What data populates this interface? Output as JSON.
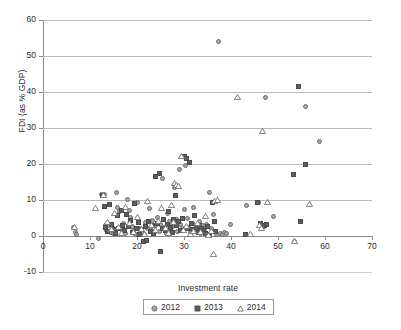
{
  "chart_data": {
    "type": "scatter",
    "title": "",
    "xlabel": "Investment rate",
    "ylabel": "FDI (as % GDP)",
    "xlim": [
      0,
      70
    ],
    "ylim": [
      -10,
      60
    ],
    "xticks": [
      0,
      10,
      20,
      30,
      40,
      50,
      60,
      70
    ],
    "yticks": [
      -10,
      0,
      10,
      20,
      30,
      40,
      50,
      60
    ],
    "grid": "horizontal",
    "legend_position": "bottom",
    "series": [
      {
        "name": "2012",
        "marker": "circle",
        "color": "#a8a8a8",
        "points": [
          [
            6.4,
            2.3
          ],
          [
            6.9,
            1.1
          ],
          [
            7.1,
            0.4
          ],
          [
            11.8,
            -0.8
          ],
          [
            12.4,
            11.4
          ],
          [
            13.0,
            11.6
          ],
          [
            13.2,
            2.8
          ],
          [
            13.6,
            1.5
          ],
          [
            14.0,
            3.0
          ],
          [
            14.3,
            1.0
          ],
          [
            14.8,
            2.4
          ],
          [
            15.1,
            0.6
          ],
          [
            15.6,
            12.2
          ],
          [
            15.9,
            7.8
          ],
          [
            16.2,
            6.9
          ],
          [
            16.5,
            2.1
          ],
          [
            16.9,
            1.2
          ],
          [
            17.2,
            3.4
          ],
          [
            17.6,
            0.8
          ],
          [
            18.0,
            10.1
          ],
          [
            18.3,
            7.1
          ],
          [
            18.6,
            5.2
          ],
          [
            19.0,
            2.6
          ],
          [
            19.3,
            1.4
          ],
          [
            19.7,
            0.5
          ],
          [
            20.1,
            9.3
          ],
          [
            20.4,
            4.2
          ],
          [
            20.8,
            2.0
          ],
          [
            21.1,
            1.1
          ],
          [
            21.5,
            0.3
          ],
          [
            21.9,
            3.8
          ],
          [
            22.2,
            2.2
          ],
          [
            22.6,
            7.6
          ],
          [
            23.0,
            1.6
          ],
          [
            23.3,
            4.4
          ],
          [
            23.7,
            0.9
          ],
          [
            24.0,
            2.9
          ],
          [
            24.4,
            5.1
          ],
          [
            24.8,
            1.3
          ],
          [
            25.1,
            3.1
          ],
          [
            25.5,
            15.9
          ],
          [
            25.8,
            2.4
          ],
          [
            26.2,
            0.7
          ],
          [
            26.5,
            6.2
          ],
          [
            26.9,
            4.0
          ],
          [
            27.2,
            1.9
          ],
          [
            27.6,
            2.7
          ],
          [
            27.9,
            13.4
          ],
          [
            28.3,
            4.6
          ],
          [
            28.6,
            1.2
          ],
          [
            29.0,
            18.6
          ],
          [
            29.3,
            3.2
          ],
          [
            29.7,
            2.1
          ],
          [
            30.0,
            7.4
          ],
          [
            30.3,
            19.6
          ],
          [
            30.7,
            4.8
          ],
          [
            31.0,
            2.5
          ],
          [
            31.4,
            1.0
          ],
          [
            31.8,
            3.6
          ],
          [
            32.1,
            7.8
          ],
          [
            32.5,
            2.2
          ],
          [
            32.9,
            1.4
          ],
          [
            33.2,
            4.1
          ],
          [
            33.6,
            0.6
          ],
          [
            34.0,
            2.8
          ],
          [
            34.3,
            1.7
          ],
          [
            34.7,
            3.3
          ],
          [
            35.1,
            0.4
          ],
          [
            35.5,
            12.1
          ],
          [
            35.8,
            2.0
          ],
          [
            36.2,
            5.9
          ],
          [
            36.6,
            1.1
          ],
          [
            37.0,
            0.3
          ],
          [
            37.4,
            54.0
          ],
          [
            37.8,
            0.8
          ],
          [
            38.2,
            0.5
          ],
          [
            38.6,
            0.9
          ],
          [
            39.0,
            0.7
          ],
          [
            39.8,
            3.3
          ],
          [
            43.4,
            8.4
          ],
          [
            45.9,
            9.2
          ],
          [
            46.3,
            3.2
          ],
          [
            47.2,
            2.7
          ],
          [
            47.4,
            38.6
          ],
          [
            49.0,
            5.3
          ],
          [
            53.6,
            -1.4
          ],
          [
            55.8,
            36.1
          ],
          [
            58.9,
            26.3
          ]
        ]
      },
      {
        "name": "2013",
        "marker": "square",
        "color": "#5e5e5e",
        "points": [
          [
            12.6,
            11.2
          ],
          [
            13.1,
            8.2
          ],
          [
            13.4,
            2.4
          ],
          [
            13.8,
            1.2
          ],
          [
            14.2,
            8.8
          ],
          [
            14.6,
            3.1
          ],
          [
            15.0,
            1.8
          ],
          [
            15.4,
            0.6
          ],
          [
            15.8,
            5.6
          ],
          [
            16.1,
            2.2
          ],
          [
            16.6,
            7.2
          ],
          [
            17.0,
            3.0
          ],
          [
            17.4,
            1.5
          ],
          [
            17.8,
            6.1
          ],
          [
            18.2,
            2.7
          ],
          [
            18.7,
            4.3
          ],
          [
            19.1,
            1.0
          ],
          [
            19.5,
            8.9
          ],
          [
            19.9,
            2.1
          ],
          [
            20.3,
            3.7
          ],
          [
            20.6,
            0.4
          ],
          [
            21.0,
            1.9
          ],
          [
            21.4,
            -1.5
          ],
          [
            21.8,
            2.6
          ],
          [
            22.0,
            -1.3
          ],
          [
            22.4,
            4.0
          ],
          [
            22.8,
            1.3
          ],
          [
            23.2,
            2.9
          ],
          [
            23.6,
            0.8
          ],
          [
            24.0,
            16.4
          ],
          [
            24.3,
            3.4
          ],
          [
            24.7,
            17.5
          ],
          [
            25.0,
            -4.2
          ],
          [
            25.4,
            2.0
          ],
          [
            25.7,
            4.7
          ],
          [
            26.1,
            1.6
          ],
          [
            26.4,
            3.2
          ],
          [
            26.8,
            6.8
          ],
          [
            27.1,
            2.3
          ],
          [
            27.5,
            1.1
          ],
          [
            27.8,
            4.5
          ],
          [
            28.2,
            11.3
          ],
          [
            28.5,
            2.8
          ],
          [
            28.9,
            3.9
          ],
          [
            29.2,
            1.4
          ],
          [
            29.6,
            5.0
          ],
          [
            30.1,
            22.0
          ],
          [
            30.5,
            21.6
          ],
          [
            30.8,
            2.2
          ],
          [
            31.1,
            20.5
          ],
          [
            31.5,
            3.5
          ],
          [
            31.9,
            1.8
          ],
          [
            32.3,
            5.8
          ],
          [
            32.7,
            2.4
          ],
          [
            33.0,
            1.0
          ],
          [
            33.4,
            3.0
          ],
          [
            33.8,
            2.0
          ],
          [
            34.2,
            1.5
          ],
          [
            34.6,
            0.7
          ],
          [
            35.0,
            2.6
          ],
          [
            35.4,
            0.3
          ],
          [
            36.0,
            9.2
          ],
          [
            36.4,
            4.0
          ],
          [
            36.8,
            1.2
          ],
          [
            43.1,
            0.5
          ],
          [
            45.7,
            9.4
          ],
          [
            46.2,
            3.4
          ],
          [
            47.1,
            2.9
          ],
          [
            47.5,
            3.1
          ],
          [
            53.3,
            17.0
          ],
          [
            54.4,
            41.6
          ],
          [
            54.8,
            4.1
          ],
          [
            55.9,
            19.8
          ]
        ]
      },
      {
        "name": "2014",
        "marker": "triangle",
        "color": "#ffffff",
        "points": [
          [
            6.6,
            2.6
          ],
          [
            11.1,
            7.8
          ],
          [
            12.9,
            11.5
          ],
          [
            13.7,
            4.0
          ],
          [
            14.5,
            1.9
          ],
          [
            15.2,
            6.3
          ],
          [
            16.0,
            2.5
          ],
          [
            16.8,
            0.8
          ],
          [
            17.5,
            8.0
          ],
          [
            18.4,
            3.5
          ],
          [
            19.2,
            1.2
          ],
          [
            20.0,
            5.4
          ],
          [
            20.9,
            2.0
          ],
          [
            21.6,
            0.5
          ],
          [
            22.3,
            9.8
          ],
          [
            23.1,
            3.0
          ],
          [
            23.9,
            1.6
          ],
          [
            24.6,
            4.2
          ],
          [
            25.3,
            7.9
          ],
          [
            26.0,
            2.3
          ],
          [
            26.7,
            0.9
          ],
          [
            27.3,
            8.6
          ],
          [
            27.7,
            3.8
          ],
          [
            28.0,
            14.6
          ],
          [
            28.4,
            14.1
          ],
          [
            28.8,
            13.9
          ],
          [
            29.5,
            22.1
          ],
          [
            29.9,
            1.8
          ],
          [
            30.6,
            2.9
          ],
          [
            31.3,
            0.6
          ],
          [
            32.0,
            1.4
          ],
          [
            32.8,
            3.6
          ],
          [
            33.5,
            1.0
          ],
          [
            34.5,
            5.5
          ],
          [
            35.2,
            0.4
          ],
          [
            35.9,
            1.5
          ],
          [
            36.5,
            9.7
          ],
          [
            37.2,
            9.9
          ],
          [
            36.2,
            -5.0
          ],
          [
            41.3,
            38.5
          ],
          [
            44.2,
            0.6
          ],
          [
            46.0,
            3.0
          ],
          [
            46.5,
            2.2
          ],
          [
            47.8,
            9.4
          ],
          [
            46.6,
            29.3
          ],
          [
            53.5,
            -1.5
          ],
          [
            56.8,
            9.0
          ]
        ]
      }
    ]
  },
  "legend": {
    "items": [
      {
        "label": "2012",
        "marker": "circle-marker"
      },
      {
        "label": "2013",
        "marker": "square-marker"
      },
      {
        "label": "2014",
        "marker": "triangle-marker"
      }
    ]
  },
  "axes": {
    "y_title": "FDI (as % GDP)",
    "x_title": "Investment rate",
    "y_tick_labels": [
      "60",
      "50",
      "40",
      "30",
      "20",
      "10",
      "0",
      "-10"
    ],
    "x_tick_labels": [
      "0",
      "10",
      "20",
      "30",
      "40",
      "50",
      "60",
      "70"
    ]
  },
  "colors": {
    "grid": "#b9b9b9",
    "axis": "#8b8b8b",
    "series_2012": "#a8a8a8",
    "series_2013": "#5e5e5e",
    "series_2014": "#ffffff",
    "text": "#2b2b2b"
  }
}
